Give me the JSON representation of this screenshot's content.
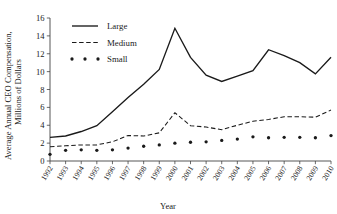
{
  "chart_data": {
    "type": "line",
    "title": "",
    "xlabel": "Year",
    "ylabel": "Average Annual CEO Compensation, Millions of Dollars",
    "ylabel_line1": "Average Annual CEO Compensation,",
    "ylabel_line2": "Millions of Dollars",
    "categories": [
      "1992",
      "1993",
      "1994",
      "1995",
      "1996",
      "1997",
      "1998",
      "1999",
      "2000",
      "2001",
      "2002",
      "2003",
      "2004",
      "2005",
      "2006",
      "2007",
      "2008",
      "2009",
      "2010"
    ],
    "x": [
      1992,
      1993,
      1994,
      1995,
      1996,
      1997,
      1998,
      1999,
      2000,
      2001,
      2002,
      2003,
      2004,
      2005,
      2006,
      2007,
      2008,
      2009,
      2010
    ],
    "ylim": [
      0,
      16
    ],
    "yticks": [
      0,
      2,
      4,
      6,
      8,
      10,
      12,
      14,
      16
    ],
    "ytick_labels": [
      "0",
      "2",
      "4",
      "6",
      "8",
      "10",
      "12",
      "14",
      "16"
    ],
    "grid": false,
    "legend_position": "top-left",
    "series": [
      {
        "name": "Large",
        "style": "solid",
        "marker": "none",
        "color": "#1a1a1a",
        "values": [
          2.65,
          2.8,
          3.3,
          3.95,
          5.5,
          7.1,
          8.6,
          10.25,
          14.85,
          11.6,
          9.6,
          8.9,
          9.5,
          10.1,
          12.45,
          11.8,
          11.0,
          9.75,
          11.6
        ]
      },
      {
        "name": "Medium",
        "style": "dashed",
        "marker": "none",
        "color": "#1a1a1a",
        "values": [
          1.6,
          1.7,
          1.8,
          1.8,
          2.15,
          2.85,
          2.8,
          3.15,
          5.4,
          3.95,
          3.8,
          3.5,
          4.0,
          4.45,
          4.65,
          4.95,
          4.95,
          4.9,
          5.7
        ]
      },
      {
        "name": "Small",
        "style": "dotted",
        "marker": "dot",
        "color": "#1a1a1a",
        "values": [
          0.75,
          1.2,
          1.25,
          1.2,
          1.25,
          1.45,
          1.65,
          1.8,
          2.0,
          2.1,
          2.15,
          2.3,
          2.45,
          2.7,
          2.6,
          2.65,
          2.65,
          2.6,
          2.85
        ]
      }
    ]
  },
  "legend": {
    "items": [
      {
        "label": "Large",
        "style": "solid"
      },
      {
        "label": "Medium",
        "style": "dashed"
      },
      {
        "label": "Small",
        "style": "dotted"
      }
    ]
  }
}
